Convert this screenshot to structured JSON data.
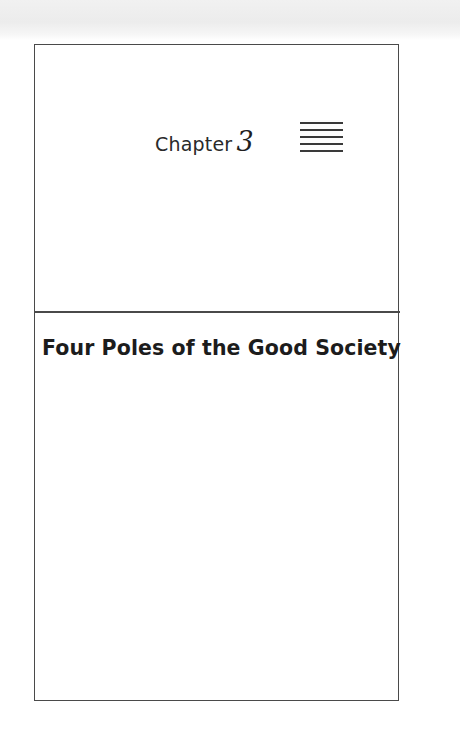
{
  "page": {
    "chapter": {
      "label": "Chapter",
      "number": "3",
      "ornament": "five-horizontal-rules"
    },
    "title": "Four Poles of the Good Society"
  },
  "colors": {
    "ink": "#1c1c1c",
    "frame": "#4a4a4a",
    "paper": "#ffffff",
    "scan_band": "#ececec"
  }
}
